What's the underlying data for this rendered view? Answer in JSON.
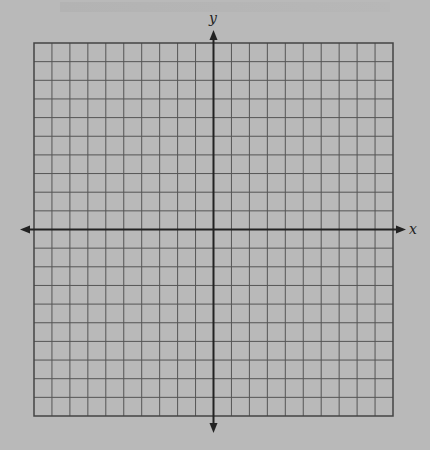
{
  "diagram": {
    "type": "coordinate-plane",
    "x_axis_label": "x",
    "y_axis_label": "y",
    "grid": {
      "columns": 20,
      "rows": 20,
      "left": 34,
      "top": 43,
      "right": 393,
      "bottom": 416
    },
    "origin": {
      "x": 213.5,
      "y": 229.5
    },
    "colors": {
      "background": "#b9b9b9",
      "grid_line": "#555555",
      "axis": "#222222"
    }
  }
}
